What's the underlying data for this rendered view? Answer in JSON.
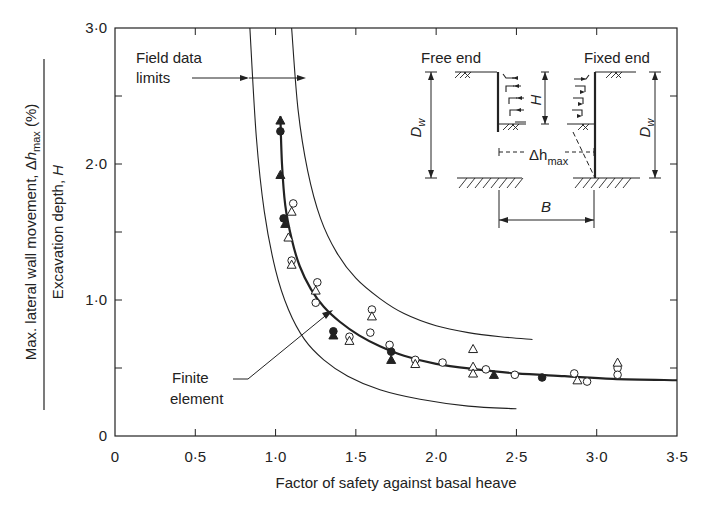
{
  "chart_data": {
    "type": "scatter",
    "title": "",
    "xlabel": "Factor of safety against basal heave",
    "ylabel": {
      "numerator": "Max. lateral wall movement, Δh_max (%)",
      "numerator_parts": [
        "Max. lateral wall movement, ",
        "Δ",
        "h",
        "max",
        " (%)"
      ],
      "denominator": "Excavation depth, H",
      "denominator_parts": [
        "Excavation depth, ",
        "H"
      ]
    },
    "xlim": [
      0,
      3.5
    ],
    "ylim": [
      0,
      3.0
    ],
    "x_ticks": [
      0,
      0.5,
      1.0,
      1.5,
      2.0,
      2.5,
      3.0,
      3.5
    ],
    "x_tick_labels": [
      "0",
      "0·5",
      "1·0",
      "1·5",
      "2·0",
      "2·5",
      "3·0",
      "3·5"
    ],
    "y_ticks": [
      0,
      0.5,
      1.0,
      1.5,
      2.0,
      2.5,
      3.0
    ],
    "y_tick_labels": [
      "0",
      "",
      "1·0",
      "",
      "2·0",
      "",
      "3·0"
    ],
    "grid": false,
    "series": [
      {
        "name": "Finite element",
        "type": "line",
        "style": "thick",
        "x": [
          1.03,
          1.04,
          1.06,
          1.1,
          1.15,
          1.22,
          1.3,
          1.4,
          1.52,
          1.65,
          1.8,
          2.0,
          2.25,
          2.5,
          2.8,
          3.1,
          3.5
        ],
        "y": [
          2.35,
          2.0,
          1.7,
          1.45,
          1.25,
          1.08,
          0.95,
          0.84,
          0.74,
          0.66,
          0.59,
          0.53,
          0.49,
          0.46,
          0.44,
          0.42,
          0.41
        ]
      },
      {
        "name": "Field data limits (upper)",
        "type": "line",
        "style": "thin",
        "x": [
          1.1,
          1.14,
          1.2,
          1.28,
          1.38,
          1.5,
          1.65,
          1.8,
          2.0,
          2.2,
          2.4,
          2.6
        ],
        "y": [
          3.0,
          2.4,
          1.95,
          1.6,
          1.35,
          1.16,
          1.01,
          0.9,
          0.81,
          0.76,
          0.73,
          0.71
        ]
      },
      {
        "name": "Field data limits (lower)",
        "type": "line",
        "style": "thin",
        "x": [
          0.84,
          0.88,
          0.93,
          1.0,
          1.08,
          1.18,
          1.3,
          1.45,
          1.65,
          1.9,
          2.2,
          2.5
        ],
        "y": [
          3.0,
          2.2,
          1.65,
          1.22,
          0.93,
          0.71,
          0.56,
          0.44,
          0.34,
          0.27,
          0.22,
          0.2
        ]
      },
      {
        "name": "Open circles",
        "type": "scatter",
        "marker": "circle-open",
        "points": [
          [
            1.11,
            1.71
          ],
          [
            1.1,
            1.29
          ],
          [
            1.26,
            1.13
          ],
          [
            1.25,
            0.98
          ],
          [
            1.46,
            0.73
          ],
          [
            1.6,
            0.93
          ],
          [
            1.59,
            0.76
          ],
          [
            1.71,
            0.67
          ],
          [
            1.87,
            0.56
          ],
          [
            2.04,
            0.54
          ],
          [
            2.31,
            0.49
          ],
          [
            2.49,
            0.45
          ],
          [
            2.86,
            0.46
          ],
          [
            2.94,
            0.4
          ],
          [
            3.13,
            0.5
          ],
          [
            3.13,
            0.45
          ]
        ]
      },
      {
        "name": "Open triangles",
        "type": "scatter",
        "marker": "triangle-open",
        "points": [
          [
            1.1,
            1.65
          ],
          [
            1.08,
            1.46
          ],
          [
            1.1,
            1.26
          ],
          [
            1.25,
            1.07
          ],
          [
            1.46,
            0.7
          ],
          [
            1.6,
            0.88
          ],
          [
            1.87,
            0.53
          ],
          [
            2.23,
            0.64
          ],
          [
            2.23,
            0.51
          ],
          [
            2.23,
            0.46
          ],
          [
            2.88,
            0.41
          ],
          [
            3.13,
            0.54
          ]
        ]
      },
      {
        "name": "Filled circles",
        "type": "scatter",
        "marker": "circle-filled",
        "points": [
          [
            1.03,
            2.24
          ],
          [
            1.05,
            1.6
          ],
          [
            1.36,
            0.77
          ],
          [
            1.72,
            0.62
          ],
          [
            2.66,
            0.43
          ]
        ]
      },
      {
        "name": "Filled triangles",
        "type": "scatter",
        "marker": "triangle-filled",
        "points": [
          [
            1.03,
            2.32
          ],
          [
            1.03,
            1.92
          ],
          [
            1.06,
            1.56
          ],
          [
            1.36,
            0.74
          ],
          [
            1.72,
            0.56
          ],
          [
            2.36,
            0.45
          ]
        ]
      }
    ],
    "annotations": [
      {
        "text": "Field data limits",
        "lines": [
          "Field data",
          "limits"
        ],
        "arrow_to": "both limit curves at y≈2.6"
      },
      {
        "text": "Finite element",
        "lines": [
          "Finite",
          "element"
        ],
        "arrow_to": "finite element curve at x≈1.3"
      }
    ],
    "inset_diagram": {
      "labels": {
        "free_end": "Free end",
        "fixed_end": "Fixed end",
        "dw_left": "D",
        "dw_left_sub": "w",
        "dw_right": "D",
        "dw_right_sub": "w",
        "h": "H",
        "delta_h": "Δh",
        "delta_h_sub": "max",
        "b": "B"
      }
    }
  }
}
